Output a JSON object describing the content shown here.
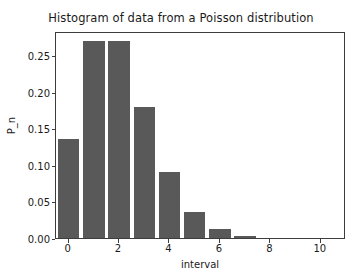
{
  "chart_data": {
    "type": "bar",
    "title": "Histogram of data from a Poisson distribution",
    "xlabel": "interval",
    "ylabel": "P_n",
    "categories": [
      0,
      1,
      2,
      3,
      4,
      5,
      6,
      7
    ],
    "values": [
      0.135,
      0.27,
      0.27,
      0.18,
      0.09,
      0.036,
      0.012,
      0.003
    ],
    "bar_color": "#595959",
    "bar_width": 0.85,
    "xlim": [
      -0.5,
      11.0
    ],
    "ylim": [
      0.0,
      0.2835
    ],
    "xticks": [
      0,
      2,
      4,
      6,
      8,
      10
    ],
    "xtick_labels": [
      "0",
      "2",
      "4",
      "6",
      "8",
      "10"
    ],
    "yticks": [
      0.0,
      0.05,
      0.1,
      0.15,
      0.2,
      0.25
    ],
    "ytick_labels": [
      "0.00",
      "0.05",
      "0.10",
      "0.15",
      "0.20",
      "0.25"
    ],
    "grid": false,
    "legend": null,
    "legend_position": "none"
  }
}
